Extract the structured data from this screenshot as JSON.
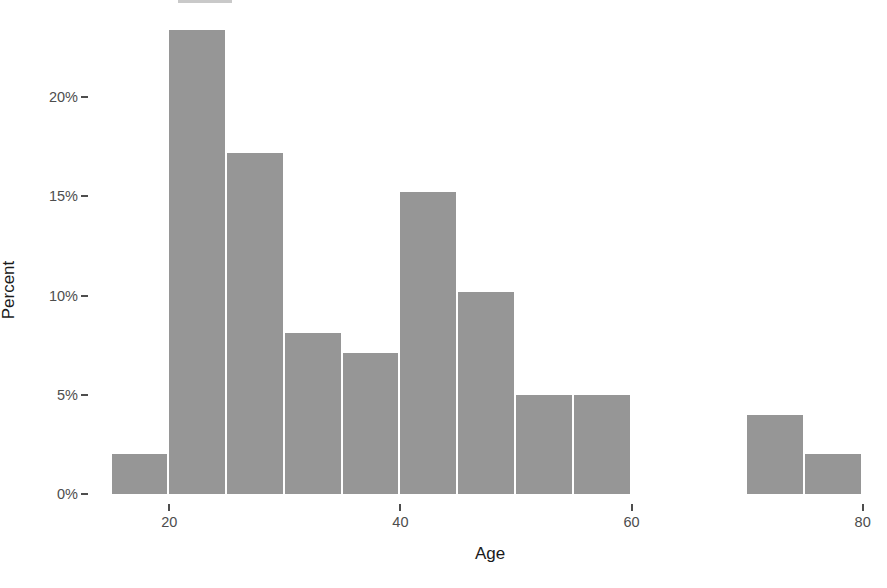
{
  "chart_data": {
    "type": "bar",
    "title": "",
    "subtitle": "",
    "xlabel": "Age",
    "ylabel": "Percent",
    "xlim": [
      14.0,
      81.5
    ],
    "ylim": [
      0,
      24.5
    ],
    "grid": false,
    "legend": null,
    "bar_color": "#969696",
    "axis_text_color": "#4d4d4d",
    "axis_title_color": "#1a1a1a",
    "background_color": "#ffffff",
    "bin_width": 5,
    "x_ticks": [
      {
        "value": 20,
        "label": "20"
      },
      {
        "value": 40,
        "label": "40"
      },
      {
        "value": 60,
        "label": "60"
      },
      {
        "value": 80,
        "label": "80"
      }
    ],
    "y_ticks": [
      {
        "value": 0,
        "label": "0%"
      },
      {
        "value": 5,
        "label": "5%"
      },
      {
        "value": 10,
        "label": "10%"
      },
      {
        "value": 15,
        "label": "15%"
      },
      {
        "value": 20,
        "label": "20%"
      }
    ],
    "bins": [
      {
        "label": "15-20",
        "x0": 15,
        "x1": 20,
        "value": 2.0
      },
      {
        "label": "20-25",
        "x0": 20,
        "x1": 25,
        "value": 23.4
      },
      {
        "label": "25-30",
        "x0": 25,
        "x1": 30,
        "value": 17.2
      },
      {
        "label": "30-35",
        "x0": 30,
        "x1": 35,
        "value": 8.1
      },
      {
        "label": "35-40",
        "x0": 35,
        "x1": 40,
        "value": 7.1
      },
      {
        "label": "40-45",
        "x0": 40,
        "x1": 45,
        "value": 15.2
      },
      {
        "label": "45-50",
        "x0": 45,
        "x1": 50,
        "value": 10.2
      },
      {
        "label": "50-55",
        "x0": 50,
        "x1": 55,
        "value": 5.0
      },
      {
        "label": "55-60",
        "x0": 55,
        "x1": 60,
        "value": 5.0
      },
      {
        "label": "70-75",
        "x0": 70,
        "x1": 75,
        "value": 4.0
      },
      {
        "label": "75-80",
        "x0": 75,
        "x1": 80,
        "value": 2.0
      }
    ],
    "categories": [
      "15-20",
      "20-25",
      "25-30",
      "30-35",
      "35-40",
      "40-45",
      "45-50",
      "50-55",
      "55-60",
      "70-75",
      "75-80"
    ],
    "values": [
      2.0,
      23.4,
      17.2,
      8.1,
      7.1,
      15.2,
      10.2,
      5.0,
      5.0,
      4.0,
      2.0
    ]
  }
}
